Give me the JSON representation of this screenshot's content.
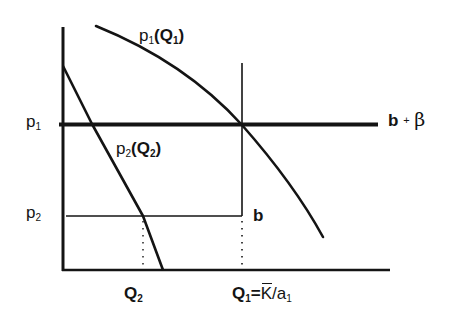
{
  "diagram": {
    "type": "economics-price-quantity-diagram",
    "axes": {
      "y_axis_labels": [
        {
          "id": "p1",
          "base": "p",
          "sub": "1"
        },
        {
          "id": "p2",
          "base": "p",
          "sub": "2"
        }
      ],
      "x_axis_labels": [
        {
          "id": "Q2",
          "base": "Q",
          "sub": "2"
        },
        {
          "id": "Q1",
          "base": "Q",
          "sub": "1",
          "rest": "=",
          "k_bar": "K",
          "slash": "/",
          "a": "a",
          "a_sub": "1"
        }
      ]
    },
    "curves": {
      "demand1": {
        "base": "p",
        "sub": "1",
        "open": "(",
        "arg": "Q",
        "arg_sub": "1",
        "close": ")"
      },
      "demand2": {
        "base": "p",
        "sub": "2",
        "prime": "'",
        "open": "(",
        "arg": "Q",
        "arg_sub": "2",
        "close": ")"
      }
    },
    "lines": {
      "upper_level": {
        "label_b": "b",
        "label_plus": "+",
        "label_beta": "β"
      },
      "lower_level": {
        "label": "b"
      }
    },
    "colors": {
      "ink": "#141414",
      "background": "#ffffff"
    }
  }
}
